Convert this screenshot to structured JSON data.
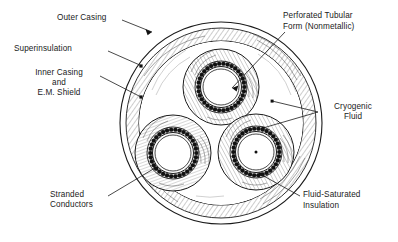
{
  "figure": {
    "type": "cross-section-diagram",
    "background_color": "#ffffff",
    "line_color": "#1a1a1a",
    "hatch_color": "#555555"
  },
  "labels": {
    "outer_casing": "Outer Casing",
    "superinsulation": "Superinsulation",
    "inner_casing_line1": "Inner Casing",
    "inner_casing_line2": "and",
    "inner_casing_line3": "E.M. Shield",
    "perforated_form_line1": "Perforated Tubular",
    "perforated_form_line2": "Form (Nonmetallic)",
    "cryogenic_fluid_line1": "Cryogenic",
    "cryogenic_fluid_line2": "Fluid",
    "stranded_conductors_line1": "Stranded",
    "stranded_conductors_line2": "Conductors",
    "fluid_saturated_line1": "Fluid-Saturated",
    "fluid_saturated_line2": "Insulation"
  },
  "geometry": {
    "outer_circle": {
      "cx": 221,
      "cy": 123,
      "r": 101
    },
    "superinsulation_outer": {
      "cx": 221,
      "cy": 123,
      "r": 95
    },
    "inner_casing_circle": {
      "cx": 221,
      "cy": 123,
      "r": 82
    },
    "cores": [
      {
        "name": "top-core",
        "cx": 221,
        "cy": 87,
        "r_form": 38,
        "r_conductor": 23
      },
      {
        "name": "lower-left-core",
        "cx": 173,
        "cy": 153,
        "r_form": 38,
        "r_conductor": 23
      },
      {
        "name": "lower-right-core",
        "cx": 256,
        "cy": 152,
        "r_form": 38,
        "r_conductor": 23
      }
    ],
    "conductor_count_per_core": 34
  }
}
